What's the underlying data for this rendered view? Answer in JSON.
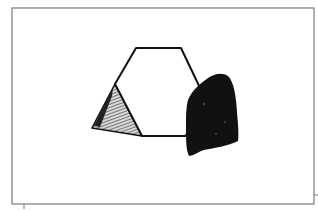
{
  "drawing": {
    "description": "Hand-drawn sketch of a hexagon with a shaded triangle on its left and a solid black shape on its right, inside a rectangular frame",
    "colors": {
      "background": "#ffffff",
      "frame": "#7a7a7a",
      "ink": "#111111",
      "shading": "#555555"
    },
    "frame": {
      "x": 12,
      "y": 8,
      "width": 302,
      "height": 196
    },
    "shapes": [
      {
        "name": "hexagon",
        "fill": "none",
        "points": "136,48 181,48 201,90 186,136 142,136 115,84"
      },
      {
        "name": "shaded-triangle",
        "fill": "hatched",
        "points": "115,84 92,128 142,136"
      },
      {
        "name": "black-blob",
        "fill": "solid",
        "points": "188,96 200,84 212,76 222,74 230,80 235,96 238,120 238,140 225,146 205,150 192,156 186,150 188,120"
      }
    ]
  }
}
